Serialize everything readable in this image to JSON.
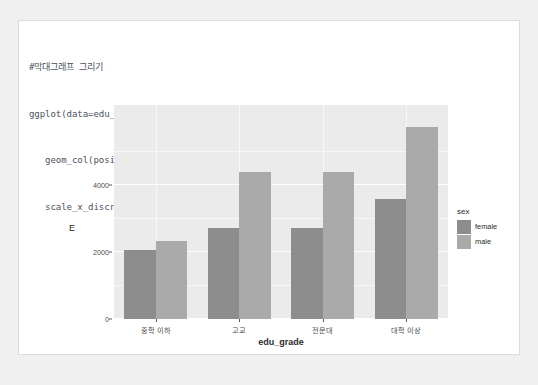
{
  "code": {
    "lines": [
      "#막대그래프 그리기",
      "ggplot(data=edu_salary2, aes(x=edu_grade, y=m, fill=sex)) + # sex별 막대 구분",
      "   geom_col(position=\"dodge\") + # position=\"dodge\"는 sex별로 별도 막대 그리기",
      "   scale_x_discrete(limits=c(\"중학 이하\",\"고교\",\"전문대\",\"대학 이상\" )) # 막대 순서 지정"
    ]
  },
  "chart_data": {
    "type": "bar",
    "title": "",
    "xlabel": "edu_grade",
    "ylabel": "E",
    "categories": [
      "중학 이하",
      "고교",
      "전문대",
      "대학 이상"
    ],
    "series": [
      {
        "name": "female",
        "color": "#8d8d8d",
        "values": [
          2060,
          2720,
          2720,
          3600
        ]
      },
      {
        "name": "male",
        "color": "#aaaaaa",
        "values": [
          2330,
          4390,
          4390,
          5730
        ]
      }
    ],
    "legend": {
      "title": "sex",
      "position": "right"
    },
    "yticks": [
      0,
      2000,
      4000
    ],
    "ytick_labels": [
      "0",
      "2000",
      "4000"
    ],
    "ylim": [
      0,
      6400
    ],
    "grid": true,
    "panel_background": "#ebebeb",
    "grid_color": "#ffffff"
  }
}
